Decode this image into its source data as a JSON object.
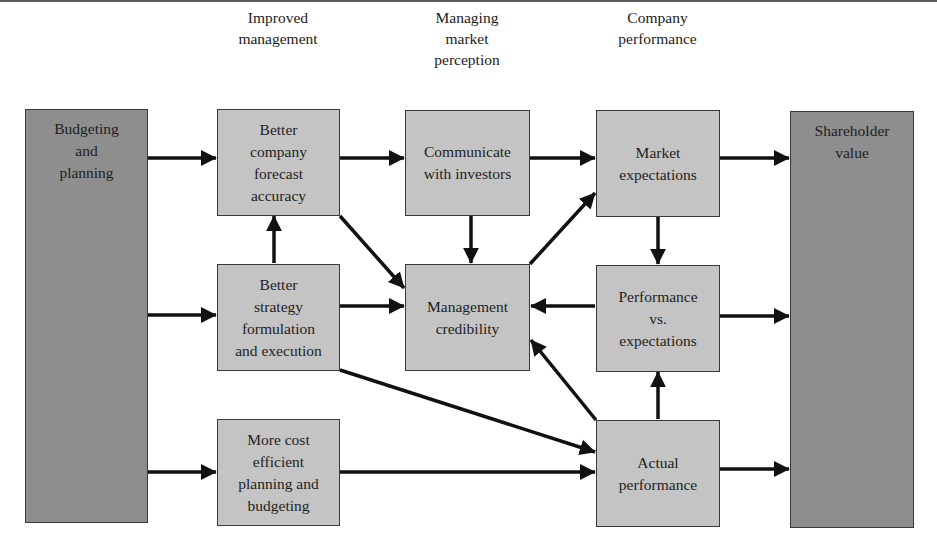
{
  "diagram": {
    "type": "flowchart",
    "column_headings": [
      {
        "id": "improved-management",
        "label": "Improved\nmanagement"
      },
      {
        "id": "managing-market-perception",
        "label": "Managing\nmarket\nperception"
      },
      {
        "id": "company-performance",
        "label": "Company\nperformance"
      }
    ],
    "nodes": {
      "budgeting": {
        "label": "Budgeting\nand\nplanning",
        "shade": "dark"
      },
      "forecast": {
        "label": "Better\ncompany\nforecast\naccuracy",
        "shade": "light"
      },
      "strategy": {
        "label": "Better\nstrategy\nformulation\nand execution",
        "shade": "light"
      },
      "cost": {
        "label": "More cost\nefficient\nplanning and\nbudgeting",
        "shade": "light"
      },
      "communicate": {
        "label": "Communicate\nwith investors",
        "shade": "light"
      },
      "credibility": {
        "label": "Management\ncredibility",
        "shade": "light"
      },
      "market_expectations": {
        "label": "Market\nexpectations",
        "shade": "light"
      },
      "perf_vs_exp": {
        "label": "Performance\nvs.\nexpectations",
        "shade": "light"
      },
      "actual": {
        "label": "Actual\nperformance",
        "shade": "light"
      },
      "shareholder": {
        "label": "Shareholder\nvalue",
        "shade": "dark"
      }
    },
    "edges": [
      {
        "from": "budgeting",
        "to": "forecast"
      },
      {
        "from": "budgeting",
        "to": "strategy"
      },
      {
        "from": "budgeting",
        "to": "cost"
      },
      {
        "from": "strategy",
        "to": "forecast"
      },
      {
        "from": "forecast",
        "to": "communicate"
      },
      {
        "from": "forecast",
        "to": "credibility"
      },
      {
        "from": "strategy",
        "to": "credibility"
      },
      {
        "from": "strategy",
        "to": "actual"
      },
      {
        "from": "cost",
        "to": "actual"
      },
      {
        "from": "communicate",
        "to": "market_expectations"
      },
      {
        "from": "communicate",
        "to": "credibility"
      },
      {
        "from": "credibility",
        "to": "market_expectations"
      },
      {
        "from": "market_expectations",
        "to": "perf_vs_exp"
      },
      {
        "from": "perf_vs_exp",
        "to": "credibility"
      },
      {
        "from": "actual",
        "to": "perf_vs_exp"
      },
      {
        "from": "actual",
        "to": "credibility"
      },
      {
        "from": "market_expectations",
        "to": "shareholder"
      },
      {
        "from": "perf_vs_exp",
        "to": "shareholder"
      },
      {
        "from": "actual",
        "to": "shareholder"
      }
    ],
    "colors": {
      "light_box": "#c4c4c4",
      "dark_box": "#8e8e8e",
      "border": "#3a3a3a",
      "arrow": "#111111"
    }
  }
}
